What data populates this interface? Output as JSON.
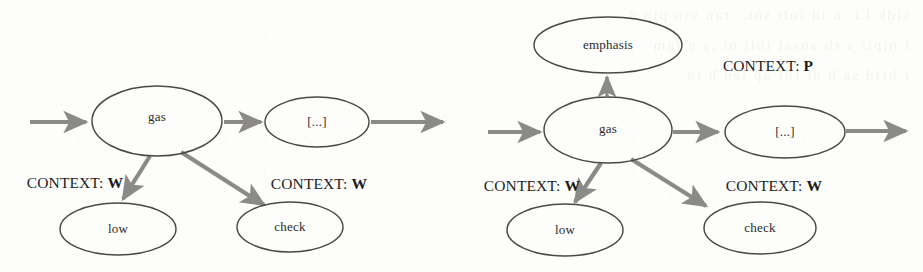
{
  "figure": {
    "type": "diagram",
    "subtype": "directed-graph",
    "background_color": "#fdfdfc",
    "node_stroke_color": "#4a4845",
    "arrow_color": "#8b8a86",
    "text_color": "#2b2a28"
  },
  "panels": [
    {
      "id": "left",
      "name": "left-graph",
      "nodes": [
        {
          "id": "l-gas",
          "label": "gas",
          "cx": 157,
          "cy": 121,
          "rx": 65,
          "ry": 35
        },
        {
          "id": "l-rest",
          "label": "[...]",
          "cx": 317,
          "cy": 122,
          "rx": 52,
          "ry": 25
        },
        {
          "id": "l-low",
          "label": "low",
          "cx": 118,
          "cy": 229,
          "rx": 58,
          "ry": 26
        },
        {
          "id": "l-check",
          "label": "check",
          "cx": 290,
          "cy": 227,
          "rx": 53,
          "ry": 25
        }
      ],
      "edges": [
        {
          "from": "entry",
          "to": "l-gas",
          "kind": "arrow"
        },
        {
          "from": "l-gas",
          "to": "l-rest",
          "kind": "arrow"
        },
        {
          "from": "l-rest",
          "to": "exit",
          "kind": "arrow"
        },
        {
          "from": "l-gas",
          "to": "l-low",
          "kind": "arrow",
          "context": "W"
        },
        {
          "from": "l-gas",
          "to": "l-check",
          "kind": "arrow",
          "context": "W"
        }
      ],
      "context_labels": [
        {
          "prefix": "CONTEXT:",
          "value": "W",
          "x": 75,
          "y": 183
        },
        {
          "prefix": "CONTEXT:",
          "value": "W",
          "x": 319,
          "y": 184
        }
      ]
    },
    {
      "id": "right",
      "name": "right-graph",
      "nodes": [
        {
          "id": "r-emphasis",
          "label": "emphasis",
          "cx": 608,
          "cy": 45,
          "rx": 74,
          "ry": 28
        },
        {
          "id": "r-gas",
          "label": "gas",
          "cx": 608,
          "cy": 130,
          "rx": 64,
          "ry": 33
        },
        {
          "id": "r-rest",
          "label": "[...]",
          "cx": 785,
          "cy": 132,
          "rx": 60,
          "ry": 26
        },
        {
          "id": "r-low",
          "label": "low",
          "cx": 565,
          "cy": 230,
          "rx": 58,
          "ry": 26
        },
        {
          "id": "r-check",
          "label": "check",
          "cx": 760,
          "cy": 228,
          "rx": 56,
          "ry": 26
        }
      ],
      "edges": [
        {
          "from": "entry",
          "to": "r-gas",
          "kind": "arrow"
        },
        {
          "from": "r-gas",
          "to": "r-emphasis",
          "kind": "arrow",
          "context": "P"
        },
        {
          "from": "r-gas",
          "to": "r-rest",
          "kind": "arrow"
        },
        {
          "from": "r-rest",
          "to": "exit",
          "kind": "arrow"
        },
        {
          "from": "r-gas",
          "to": "r-low",
          "kind": "arrow",
          "context": "W"
        },
        {
          "from": "r-gas",
          "to": "r-check",
          "kind": "arrow",
          "context": "W"
        }
      ],
      "context_labels": [
        {
          "prefix": "CONTEXT:",
          "value": "P",
          "x": 768,
          "y": 66
        },
        {
          "prefix": "CONTEXT:",
          "value": "W",
          "x": 532,
          "y": 186
        },
        {
          "prefix": "CONTEXT:",
          "value": "W",
          "x": 774,
          "y": 186
        }
      ]
    }
  ],
  "labels": {
    "gas": "gas",
    "low": "low",
    "check": "check",
    "emphasis": "emphasis",
    "ellipsis_left": "[...]",
    "ellipsis_right": "[...]",
    "context_prefix": "CONTEXT:",
    "context_w": "W",
    "context_p": "P"
  },
  "bleed_text": [
    "sidk Li :n id fuli sot. .ran vio pin d",
    "t nipir  s.rb ansat tbit  ni  ,a e  fam",
    "r brid    sa h   nt  rhr  ap  ied  h th",
    "",
    "",
    "",
    "",
    "",
    "",
    "ni  .rh  tis   .an  hed     rib   .ni",
    "",
    "",
    "st  .niht  ti  snd   n rh   d.    a ti",
    "",
    "",
    "",
    "",
    "ha  sn.ribit  vi    n h    is nd  r  it",
    "",
    "",
    "ra   sn ribit  d     n r    is  nt  .a"
  ]
}
